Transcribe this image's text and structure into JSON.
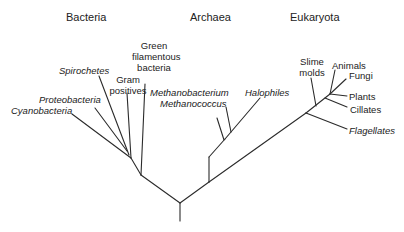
{
  "diagram": {
    "type": "phylogenetic-tree",
    "domains": [
      {
        "key": "bacteria",
        "label": "Bacteria"
      },
      {
        "key": "archaea",
        "label": "Archaea"
      },
      {
        "key": "eukaryota",
        "label": "Eukaryota"
      }
    ],
    "taxa": {
      "bacteria": {
        "cyanobacteria": "Cyanobacteria",
        "proteobacteria": "Proteobacteria",
        "spirochetes": "Spirochetes",
        "gram_positives_1": "Gram",
        "gram_positives_2": "positives",
        "green_filamentous_1": "Green",
        "green_filamentous_2": "filamentous",
        "green_filamentous_3": "bacteria"
      },
      "archaea": {
        "methanobacterium": "Methanobacterium",
        "methanococcus": "Methanococcus",
        "halophiles": "Halophiles"
      },
      "eukaryota": {
        "slime_molds_1": "Slime",
        "slime_molds_2": "molds",
        "animals": "Animals",
        "fungi": "Fungi",
        "plants": "Plants",
        "cillates": "Cillates",
        "flagellates": "Flagellates"
      }
    },
    "italic_taxa": [
      "Cyanobacteria",
      "Proteobacteria",
      "Spirochetes",
      "Methanobacterium",
      "Methanococcus",
      "Halophiles",
      "Flagellates"
    ],
    "line_color": "#2b2b2b"
  }
}
